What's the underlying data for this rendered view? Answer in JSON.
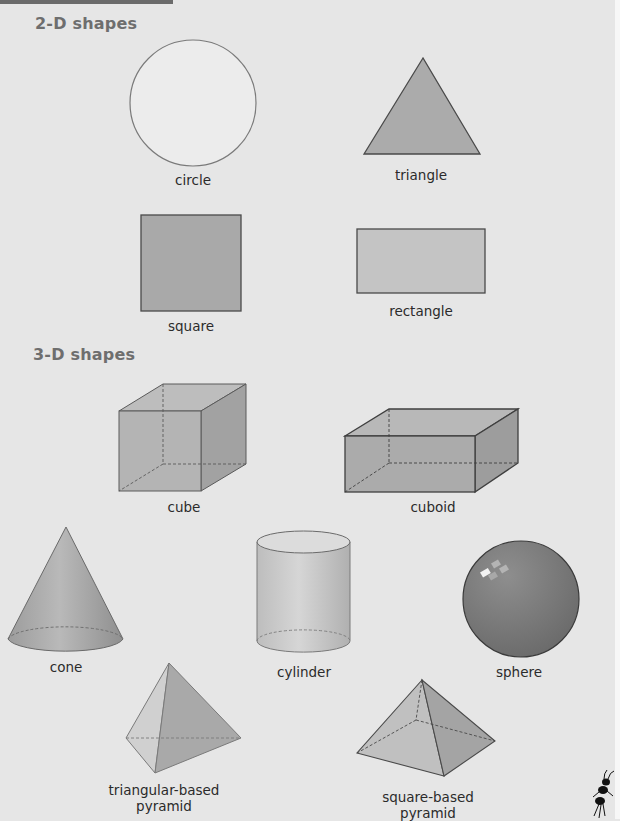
{
  "sections": {
    "two_d": {
      "heading": "2-D shapes",
      "shapes": [
        {
          "id": "circle",
          "label": "circle"
        },
        {
          "id": "triangle",
          "label": "triangle"
        },
        {
          "id": "square",
          "label": "square"
        },
        {
          "id": "rectangle",
          "label": "rectangle"
        }
      ]
    },
    "three_d": {
      "heading": "3-D shapes",
      "shapes": [
        {
          "id": "cube",
          "label": "cube"
        },
        {
          "id": "cuboid",
          "label": "cuboid"
        },
        {
          "id": "cone",
          "label": "cone"
        },
        {
          "id": "cylinder",
          "label": "cylinder"
        },
        {
          "id": "sphere",
          "label": "sphere"
        },
        {
          "id": "triangular-pyramid",
          "label_line1": "triangular-based",
          "label_line2": "pyramid"
        },
        {
          "id": "square-pyramid",
          "label_line1": "square-based",
          "label_line2": "pyramid"
        }
      ]
    }
  },
  "colors": {
    "background": "#e6e6e6",
    "heading": "#6e6e6e",
    "shape_fill_dark": "#a8a8a8",
    "shape_fill_light": "#c4c4c4",
    "outline": "#555555"
  }
}
